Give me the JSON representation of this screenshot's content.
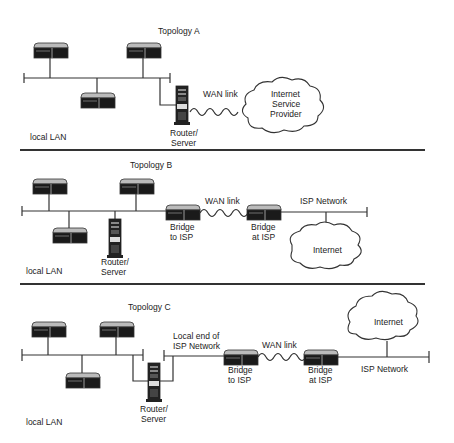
{
  "topology_a": {
    "title": "Topology A",
    "lan_label": "local LAN",
    "router_label": [
      "Router/",
      "Server"
    ],
    "wan_label": "WAN link",
    "cloud_label": [
      "Internet",
      "Service",
      "Provider"
    ]
  },
  "topology_b": {
    "title": "Topology B",
    "lan_label": "local LAN",
    "router_label": [
      "Router/",
      "Server"
    ],
    "bridge_local_label": [
      "Bridge",
      "to ISP"
    ],
    "wan_label": "WAN link",
    "bridge_isp_label": [
      "Bridge",
      "at ISP"
    ],
    "isp_network_label": "ISP Network",
    "cloud_label": "Internet"
  },
  "topology_c": {
    "title": "Topology C",
    "lan_label": "local LAN",
    "router_label": [
      "Router/",
      "Server"
    ],
    "local_end_label": [
      "Local end of",
      "ISP Network"
    ],
    "bridge_local_label": [
      "Bridge",
      "to ISP"
    ],
    "wan_label": "WAN link",
    "bridge_isp_label": [
      "Bridge",
      "at ISP"
    ],
    "isp_network_label": "ISP Network",
    "cloud_label": "Internet"
  }
}
